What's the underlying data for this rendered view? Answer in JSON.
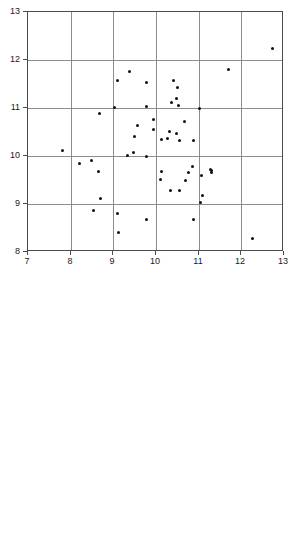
{
  "figure": {
    "title": "",
    "background": "#ffffff",
    "point_color": "#111111",
    "grid_color": "#8d8d8d",
    "axis_color": "#4a4a4a"
  },
  "chart_data": [
    {
      "type": "scatter",
      "title": "",
      "xlabel": "",
      "ylabel": "",
      "xlim": [
        7,
        13
      ],
      "ylim": [
        8,
        13
      ],
      "xticks": [
        7,
        8,
        9,
        10,
        11,
        12,
        13
      ],
      "yticks": [
        8,
        9,
        10,
        11,
        12,
        13
      ],
      "xticklabels": [
        "7",
        "8",
        "9",
        "10",
        "11",
        "12",
        "13"
      ],
      "yticklabels": [
        "8",
        "9",
        "10",
        "11",
        "12",
        "13"
      ],
      "grid": true,
      "legend": null,
      "marker": "circle",
      "n_points": 55,
      "points": [
        [
          12.72,
          12.25
        ],
        [
          11.7,
          11.8
        ],
        [
          9.38,
          11.77
        ],
        [
          9.1,
          11.57
        ],
        [
          9.77,
          11.54
        ],
        [
          10.42,
          11.58
        ],
        [
          10.5,
          11.42
        ],
        [
          10.47,
          11.2
        ],
        [
          10.37,
          11.12
        ],
        [
          10.52,
          11.05
        ],
        [
          9.78,
          11.03
        ],
        [
          9.03,
          11.01
        ],
        [
          11.03,
          10.99
        ],
        [
          8.68,
          10.89
        ],
        [
          9.93,
          10.76
        ],
        [
          10.66,
          10.71
        ],
        [
          9.57,
          10.64
        ],
        [
          9.93,
          10.55
        ],
        [
          10.31,
          10.52
        ],
        [
          10.48,
          10.47
        ],
        [
          9.5,
          10.4
        ],
        [
          10.12,
          10.35
        ],
        [
          10.26,
          10.36
        ],
        [
          10.55,
          10.33
        ],
        [
          10.87,
          10.33
        ],
        [
          7.82,
          10.12
        ],
        [
          9.47,
          10.07
        ],
        [
          9.33,
          10.01
        ],
        [
          9.78,
          9.99
        ],
        [
          8.48,
          9.91
        ],
        [
          10.85,
          9.79
        ],
        [
          8.2,
          9.85
        ],
        [
          11.27,
          9.72
        ],
        [
          11.3,
          9.69
        ],
        [
          11.31,
          9.65
        ],
        [
          8.66,
          9.68
        ],
        [
          10.12,
          9.67
        ],
        [
          10.76,
          9.66
        ],
        [
          11.07,
          9.6
        ],
        [
          10.11,
          9.52
        ],
        [
          10.7,
          9.49
        ],
        [
          10.35,
          9.28
        ],
        [
          10.55,
          9.28
        ],
        [
          11.08,
          9.18
        ],
        [
          8.7,
          9.11
        ],
        [
          11.05,
          9.03
        ],
        [
          8.54,
          8.86
        ],
        [
          9.1,
          8.81
        ],
        [
          9.77,
          8.68
        ],
        [
          10.87,
          8.68
        ],
        [
          9.12,
          8.41
        ],
        [
          12.25,
          8.29
        ]
      ]
    },
    {
      "type": "scatter",
      "title": "",
      "xlabel": "",
      "ylabel": "",
      "xlim": [
        6,
        12
      ],
      "ylim": [
        8,
        13
      ],
      "xticks": [
        6,
        7,
        8,
        9,
        10,
        11,
        12
      ],
      "yticks": [
        8,
        9,
        10,
        11,
        12,
        13
      ],
      "xticklabels": [
        "6",
        "7",
        "8",
        "9",
        "10",
        "11",
        "12"
      ],
      "yticklabels": [
        "8",
        "9",
        "10",
        "11",
        "12",
        "13"
      ],
      "grid": true,
      "legend": null,
      "marker": "circle",
      "n_points": 55,
      "points": [
        [
          11.85,
          12.88
        ],
        [
          8.35,
          12.5
        ],
        [
          8.05,
          12.31
        ],
        [
          9.63,
          12.16
        ],
        [
          8.98,
          12.14
        ],
        [
          9.82,
          11.98
        ],
        [
          8.07,
          11.71
        ],
        [
          9.73,
          11.74
        ],
        [
          9.63,
          11.66
        ],
        [
          8.93,
          11.63
        ],
        [
          7.7,
          11.6
        ],
        [
          10.27,
          11.58
        ],
        [
          9.28,
          11.31
        ],
        [
          9.87,
          11.29
        ],
        [
          8.86,
          11.23
        ],
        [
          9.19,
          11.16
        ],
        [
          9.45,
          11.15
        ],
        [
          9.52,
          11.07
        ],
        [
          9.2,
          11.05
        ],
        [
          9.34,
          10.93
        ],
        [
          9.7,
          10.91
        ],
        [
          8.68,
          10.95
        ],
        [
          6.76,
          10.9
        ],
        [
          9.05,
          10.8
        ],
        [
          8.66,
          10.63
        ],
        [
          8.51,
          10.59
        ],
        [
          9.0,
          10.55
        ],
        [
          7.28,
          10.48
        ],
        [
          7.7,
          10.5
        ],
        [
          10.38,
          10.39
        ],
        [
          10.4,
          10.36
        ],
        [
          10.43,
          10.34
        ],
        [
          10.04,
          10.4
        ],
        [
          7.91,
          10.27
        ],
        [
          10.0,
          10.26
        ],
        [
          10.2,
          10.22
        ],
        [
          9.36,
          10.19
        ],
        [
          9.33,
          10.09
        ],
        [
          9.97,
          10.08
        ],
        [
          9.32,
          9.91
        ],
        [
          9.62,
          9.91
        ],
        [
          10.06,
          9.85
        ],
        [
          10.15,
          9.71
        ],
        [
          7.86,
          9.67
        ],
        [
          7.71,
          9.46
        ],
        [
          9.9,
          9.4
        ],
        [
          8.33,
          9.42
        ],
        [
          9.04,
          9.3
        ],
        [
          11.1,
          9.18
        ],
        [
          8.26,
          9.01
        ],
        [
          9.32,
          8.71
        ]
      ]
    }
  ]
}
